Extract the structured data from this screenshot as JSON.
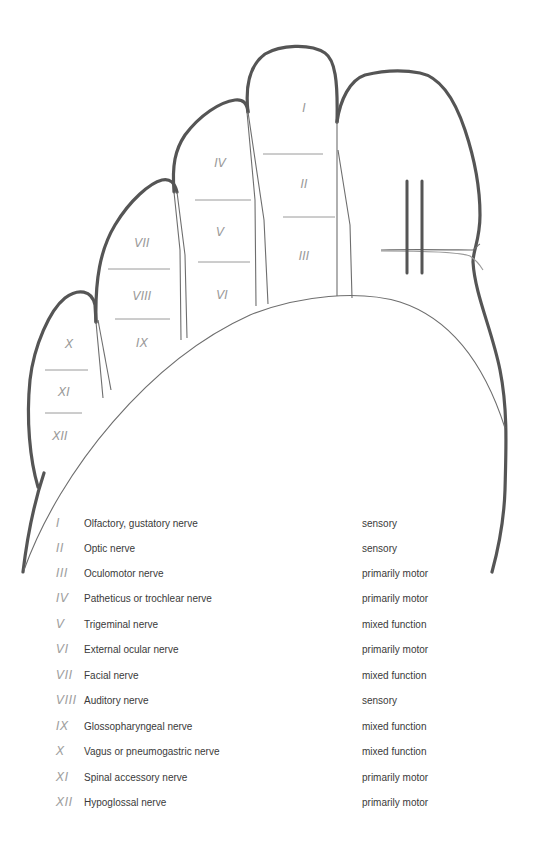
{
  "diagram": {
    "finger_labels": {
      "index": [
        "I",
        "II",
        "III"
      ],
      "middle": [
        "IV",
        "V",
        "VI"
      ],
      "ring": [
        "VII",
        "VIII",
        "IX"
      ],
      "little": [
        "X",
        "XI",
        "XII"
      ]
    },
    "colors": {
      "outline": "#555555",
      "thin_line": "#777777",
      "divider": "#9a9a9a",
      "numeral": "#9a9a9a",
      "text": "#3a3a3a"
    }
  },
  "legend": {
    "rows": [
      {
        "numeral": "I",
        "name": "Olfactory, gustatory nerve",
        "function": "sensory"
      },
      {
        "numeral": "II",
        "name": "Optic nerve",
        "function": "sensory"
      },
      {
        "numeral": "III",
        "name": "Oculomotor nerve",
        "function": "primarily motor"
      },
      {
        "numeral": "IV",
        "name": "Patheticus or trochlear nerve",
        "function": "primarily motor"
      },
      {
        "numeral": "V",
        "name": "Trigeminal nerve",
        "function": "mixed function"
      },
      {
        "numeral": "VI",
        "name": "External ocular nerve",
        "function": "primarily motor"
      },
      {
        "numeral": "VII",
        "name": "Facial nerve",
        "function": "mixed function"
      },
      {
        "numeral": "VIII",
        "name": "Auditory nerve",
        "function": "sensory"
      },
      {
        "numeral": "IX",
        "name": "Glossopharyngeal nerve",
        "function": "mixed function"
      },
      {
        "numeral": "X",
        "name": "Vagus or pneumogastric nerve",
        "function": "mixed function"
      },
      {
        "numeral": "XI",
        "name": "Spinal accessory nerve",
        "function": "primarily motor"
      },
      {
        "numeral": "XII",
        "name": "Hypoglossal nerve",
        "function": "primarily motor"
      }
    ]
  }
}
